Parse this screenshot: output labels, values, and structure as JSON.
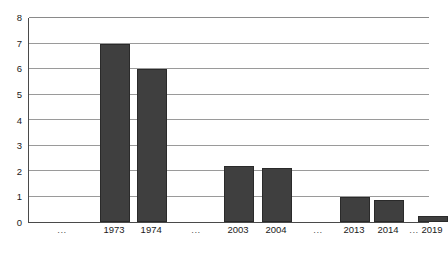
{
  "chart_data": {
    "type": "bar",
    "title": "",
    "subtitle": "",
    "xlabel": "",
    "ylabel": "",
    "categories": [
      "...",
      "1973",
      "1974",
      "...",
      "2003",
      "2004",
      "...",
      "2013",
      "2014",
      "...",
      "2019"
    ],
    "values": [
      null,
      7.0,
      6.0,
      null,
      2.2,
      2.1,
      null,
      1.0,
      0.85,
      null,
      0.25
    ],
    "ylim": [
      0,
      8
    ],
    "y_ticks": [
      0,
      1,
      2,
      3,
      4,
      5,
      6,
      7,
      8
    ],
    "y_tick_labels": [
      "0",
      "1",
      "2",
      "3",
      "4",
      "5",
      "6",
      "7",
      "8"
    ],
    "grid": true,
    "grid_axis": "y",
    "legend": false,
    "legend_position": "none",
    "bar_color": "#3f3f3f",
    "bar_edge_color": "#2a2a2a",
    "grid_color": "#9a9a9a",
    "axis_color": "#4a4a4a",
    "background_color": "#ffffff",
    "text_color": "#1a1a1a",
    "bars": [
      {
        "label": "...",
        "value": null,
        "is_gap": true,
        "center_pct": 8.5
      },
      {
        "label": "1973",
        "value": 7.0,
        "is_gap": false,
        "center_pct": 21.5
      },
      {
        "label": "1974",
        "value": 6.0,
        "is_gap": false,
        "center_pct": 30.8
      },
      {
        "label": "...",
        "value": null,
        "is_gap": true,
        "center_pct": 42.0
      },
      {
        "label": "2003",
        "value": 2.2,
        "is_gap": false,
        "center_pct": 52.5
      },
      {
        "label": "2004",
        "value": 2.1,
        "is_gap": false,
        "center_pct": 62.0
      },
      {
        "label": "...",
        "value": null,
        "is_gap": true,
        "center_pct": 72.5
      },
      {
        "label": "2013",
        "value": 1.0,
        "is_gap": false,
        "center_pct": 81.5
      },
      {
        "label": "2014",
        "value": 0.85,
        "is_gap": false,
        "center_pct": 90.0
      },
      {
        "label": "...",
        "value": null,
        "is_gap": true,
        "center_pct": 96.5
      },
      {
        "label": "2019",
        "value": 0.25,
        "is_gap": false,
        "center_pct": 101.0
      }
    ]
  }
}
